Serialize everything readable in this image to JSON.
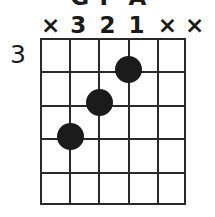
{
  "diagram": {
    "type": "guitar-chord-diagram",
    "starting_fret_label": "3",
    "string_count": 6,
    "fret_count": 5,
    "line_color": "#2a2a2a",
    "dot_color": "#1b1b1b",
    "background_color": "#ffffff"
  },
  "title_row": {
    "clipped": true,
    "notes": [
      "G",
      "F",
      "A"
    ],
    "note_positions": [
      29.2,
      58.4,
      87.6
    ]
  },
  "markers": {
    "labels": [
      "×",
      "3",
      "2",
      "1",
      "×",
      "×"
    ],
    "meanings": [
      "muted",
      "finger-3",
      "finger-2",
      "finger-1",
      "muted",
      "muted"
    ]
  },
  "dots": [
    {
      "string": 4,
      "fret": 1,
      "finger": "1",
      "left": 87.6,
      "top": 16.7,
      "size": 27
    },
    {
      "string": 3,
      "fret": 2,
      "finger": "2",
      "left": 58.4,
      "top": 50.1,
      "size": 27
    },
    {
      "string": 2,
      "fret": 3,
      "finger": "3",
      "left": 29.2,
      "top": 83.5,
      "size": 27
    }
  ],
  "geometry": {
    "string_x": [
      0,
      29.2,
      58.4,
      87.6,
      116.8,
      144
    ],
    "fret_y": [
      0,
      33.4,
      66.8,
      100.2,
      133.6,
      165
    ]
  }
}
